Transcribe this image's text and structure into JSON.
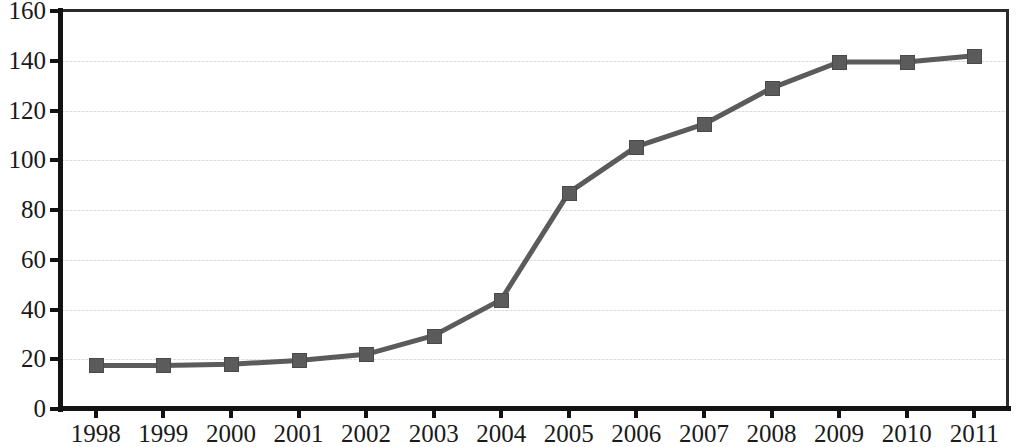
{
  "chart_data": {
    "type": "line",
    "title": "",
    "subtitle": "",
    "xlabel": "",
    "ylabel": "",
    "categories": [
      "1998",
      "1999",
      "2000",
      "2001",
      "2002",
      "2003",
      "2004",
      "2005",
      "2006",
      "2007",
      "2008",
      "2009",
      "2010",
      "2011"
    ],
    "values": [
      17.5,
      17.5,
      18,
      19.5,
      22,
      29.5,
      44,
      87,
      105.5,
      114.5,
      129,
      139.5,
      139.5,
      142
    ],
    "series": [
      {
        "name": "",
        "values": [
          17.5,
          17.5,
          18,
          19.5,
          22,
          29.5,
          44,
          87,
          105.5,
          114.5,
          129,
          139.5,
          139.5,
          142
        ]
      }
    ],
    "ylim": [
      0,
      160
    ],
    "yticks": [
      0,
      20,
      40,
      60,
      80,
      100,
      120,
      140,
      160
    ],
    "ytick_labels": [
      "0",
      "20",
      "40",
      "60",
      "80",
      "100",
      "120",
      "140",
      "160"
    ],
    "xtick_labels": [
      "1998",
      "1999",
      "2000",
      "2001",
      "2002",
      "2003",
      "2004",
      "2005",
      "2006",
      "2007",
      "2008",
      "2009",
      "2010",
      "2011"
    ],
    "grid": true,
    "grid_axis": "y",
    "legend": false,
    "legend_position": "none",
    "marker": "square",
    "line_color": "#5b5b5b",
    "marker_color": "#5b5b5b",
    "axis_color": "#121212",
    "grid_color": "#d8d8d8",
    "background_color": "#ffffff",
    "annotations": []
  }
}
